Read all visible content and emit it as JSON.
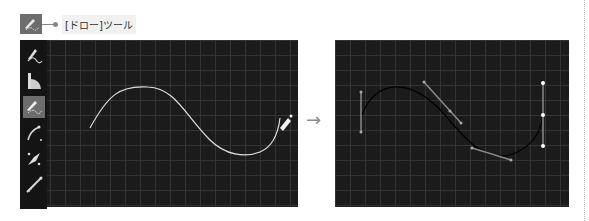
{
  "callout": {
    "label": "[ドロー]ツール",
    "icon": "draw-tool-icon"
  },
  "toolbar": {
    "tools": [
      {
        "name": "freehand-pen-tool",
        "icon": "pen-curve-icon",
        "active": false
      },
      {
        "name": "ruler-tool",
        "icon": "protractor-ruler-icon",
        "active": false
      },
      {
        "name": "draw-tool",
        "icon": "draw-tool-icon",
        "active": true
      },
      {
        "name": "bezier-tool",
        "icon": "bezier-curve-icon",
        "active": false
      },
      {
        "name": "node-tool",
        "icon": "diamond-node-icon",
        "active": false
      },
      {
        "name": "handle-tool",
        "icon": "handle-line-icon",
        "active": false
      }
    ]
  },
  "transition_arrow": "→",
  "colors": {
    "canvas_bg": "#1b1b1b",
    "grid": "#333333",
    "toolbar_bg": "#141414",
    "active_tool_bg": "#6d6d6d",
    "stroke_before": "#e0e0e0",
    "stroke_after": "#000000",
    "handle": "#8a8a8a"
  }
}
